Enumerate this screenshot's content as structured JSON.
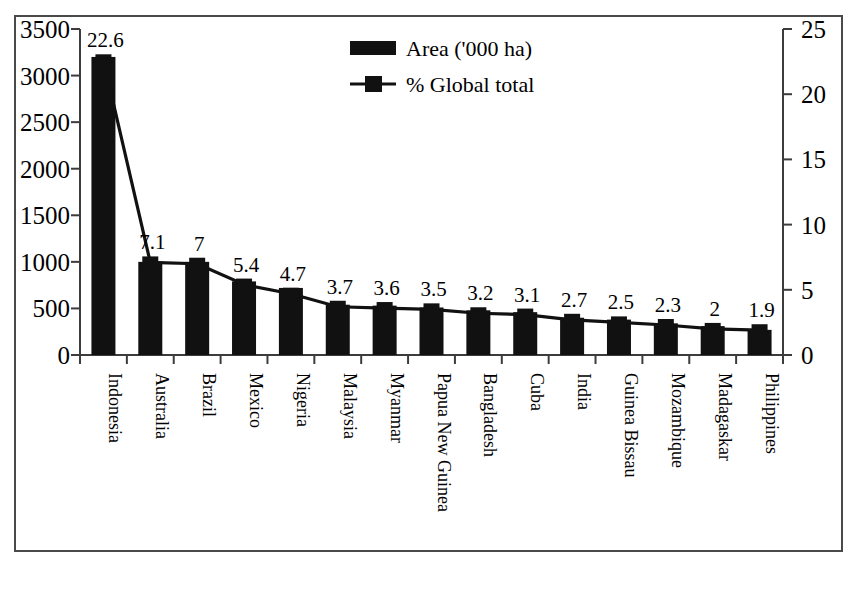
{
  "chart_data": {
    "type": "bar",
    "title": "",
    "subtitle": "",
    "xlabel": "",
    "ylabel": "",
    "y2label": "",
    "grid": false,
    "legend_position": "top-center",
    "categories": [
      "Indonesia",
      "Australia",
      "Brazil",
      "Mexico",
      "Nigeria",
      "Malaysia",
      "Myanmar",
      "Papua New Guinea",
      "Bangladesh",
      "Cuba",
      "India",
      "Guinea Bissau",
      "Mozambique",
      "Madagaskar",
      "Philippines"
    ],
    "series": [
      {
        "name": "Area ('000 ha)",
        "axis": "left",
        "type": "bar",
        "values": [
          3200,
          1000,
          1000,
          790,
          720,
          540,
          530,
          510,
          480,
          460,
          400,
          380,
          340,
          310,
          270
        ]
      },
      {
        "name": "% Global total",
        "axis": "right",
        "type": "line",
        "values": [
          22.6,
          7.1,
          7,
          5.4,
          4.7,
          3.7,
          3.6,
          3.5,
          3.2,
          3.1,
          2.7,
          2.5,
          2.3,
          2,
          1.9
        ],
        "point_labels": [
          "22.6",
          "7.1",
          "7",
          "5.4",
          "4.7",
          "3.7",
          "3.6",
          "3.5",
          "3.2",
          "3.1",
          "2.7",
          "2.5",
          "2.3",
          "2",
          "1.9"
        ]
      }
    ],
    "ylim": [
      0,
      3500
    ],
    "yticks": [
      0,
      500,
      1000,
      1500,
      2000,
      2500,
      3000,
      3500
    ],
    "ytick_labels": [
      "0",
      "500",
      "1000",
      "1500",
      "2000",
      "2500",
      "3000",
      "3500"
    ],
    "y2lim": [
      0,
      25
    ],
    "y2ticks": [
      0,
      5,
      10,
      15,
      20,
      25
    ],
    "y2tick_labels": [
      "0",
      "5",
      "10",
      "15",
      "20",
      "25"
    ]
  },
  "legend": {
    "entries": [
      {
        "label": "Area ('000 ha)",
        "marker": "filled-rectangle",
        "color": "#111111"
      },
      {
        "label": "% Global total",
        "marker": "line-with-square",
        "color": "#111111"
      }
    ]
  },
  "colors": {
    "bar": "#111111",
    "line": "#111111",
    "axis": "#3c3c3c",
    "frame": "#4a4a4a",
    "background": "#ffffff",
    "text": "#000000"
  }
}
